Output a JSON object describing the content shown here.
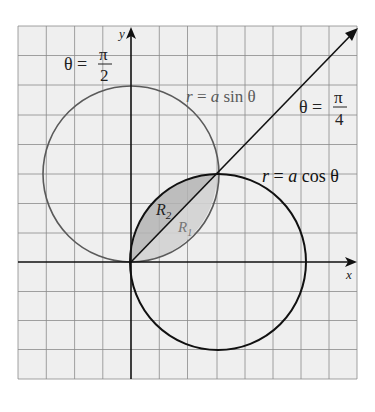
{
  "figure": {
    "axes": {
      "x_label": "x",
      "y_label": "y"
    },
    "curves": [
      {
        "name": "sin-circle",
        "label": "r = a sin θ",
        "label_parts": [
          "r",
          " = ",
          "a",
          " sin θ"
        ],
        "color": "#5a5a5a"
      },
      {
        "name": "cos-circle",
        "label": "r = a cos θ",
        "label_parts": [
          "r",
          " = ",
          "a",
          " cos θ"
        ],
        "color": "#111111"
      }
    ],
    "rays": [
      {
        "name": "theta-pi-over-2",
        "lhs": "θ = ",
        "num": "π",
        "den": "2"
      },
      {
        "name": "theta-pi-over-4",
        "lhs": "θ = ",
        "num": "π",
        "den": "4"
      }
    ],
    "regions": [
      {
        "name": "R2",
        "letter": "R",
        "sub": "2",
        "fill": "#b4b4b4"
      },
      {
        "name": "R1",
        "letter": "R",
        "sub": "1",
        "fill": "#d2d2d2"
      }
    ],
    "colors": {
      "background": "#efefef",
      "grid": "#8a8a8a",
      "axis": "#111111"
    }
  }
}
